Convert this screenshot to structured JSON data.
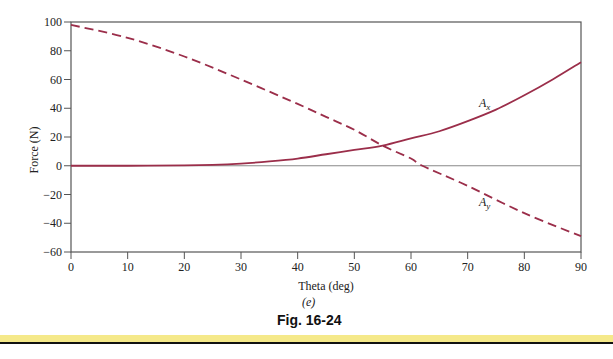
{
  "figure": {
    "subcaption": "(e)",
    "caption": "Fig. 16-24"
  },
  "chart_data": {
    "type": "line",
    "title": "",
    "xlabel": "Theta (deg)",
    "ylabel": "Force (N)",
    "xlim": [
      0,
      90
    ],
    "ylim": [
      -60,
      100
    ],
    "xticks": [
      0,
      10,
      20,
      30,
      40,
      50,
      60,
      70,
      80,
      90
    ],
    "yticks": [
      100,
      80,
      60,
      40,
      20,
      0,
      -20,
      -40,
      -60
    ],
    "grid": false,
    "zero_line": true,
    "legend": "inline labels",
    "series": [
      {
        "name": "A_x",
        "label_main": "A",
        "label_sub": "x",
        "style": "solid",
        "color": "#9b2e4a",
        "x": [
          0,
          10,
          20,
          25,
          30,
          35,
          40,
          45,
          50,
          55,
          60,
          65,
          70,
          75,
          80,
          85,
          90
        ],
        "y": [
          0,
          0,
          0.2,
          0.6,
          1.5,
          3,
          5,
          8,
          11,
          14,
          19,
          24,
          31,
          39,
          49,
          60,
          72
        ],
        "label_at": [
          72,
          41
        ]
      },
      {
        "name": "A_y",
        "label_main": "A",
        "label_sub": "y",
        "style": "dashed",
        "color": "#9b2e4a",
        "x": [
          0,
          10,
          20,
          30,
          40,
          45,
          50,
          55,
          60,
          62,
          70,
          80,
          90
        ],
        "y": [
          98,
          89,
          76,
          60,
          43,
          34,
          25,
          14,
          5,
          0,
          -14,
          -33,
          -49
        ],
        "label_at": [
          72,
          -28
        ]
      }
    ]
  }
}
